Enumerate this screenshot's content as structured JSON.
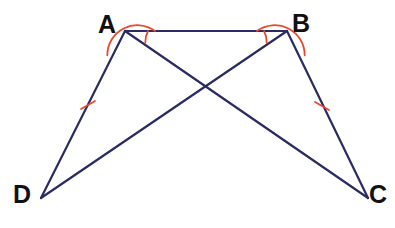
{
  "figure": {
    "type": "geometry-diagram",
    "canvas": {
      "width": 395,
      "height": 228
    },
    "background_color": "#ffffff",
    "line_color": "#2b2b63",
    "mark_color": "#e8492a",
    "label_color": "#111111",
    "line_width": 2.2,
    "mark_width": 1.8
  },
  "points": {
    "A": {
      "label": "A",
      "x": 125,
      "y": 31,
      "label_x": 98,
      "label_y": 12
    },
    "B": {
      "label": "B",
      "x": 287,
      "y": 31,
      "label_x": 292,
      "label_y": 11
    },
    "C": {
      "label": "C",
      "x": 368,
      "y": 198,
      "label_x": 369,
      "label_y": 182
    },
    "D": {
      "label": "D",
      "x": 41,
      "y": 198,
      "label_x": 13,
      "label_y": 182
    }
  },
  "segments": [
    {
      "name": "segment-AB",
      "from": "A",
      "to": "B"
    },
    {
      "name": "segment-AD",
      "from": "A",
      "to": "D"
    },
    {
      "name": "segment-BC",
      "from": "B",
      "to": "C"
    },
    {
      "name": "segment-AC",
      "from": "A",
      "to": "C"
    },
    {
      "name": "segment-BD",
      "from": "B",
      "to": "D"
    }
  ],
  "intersection": {
    "name": "diagonal-intersection",
    "x": 206,
    "y": 88
  },
  "tick_marks": [
    {
      "name": "tick-mark-AD",
      "on_segment": "segment-AD",
      "count": 1,
      "x": 88,
      "y": 105,
      "x1": 81,
      "y1": 109,
      "x2": 95,
      "y2": 101
    },
    {
      "name": "tick-mark-BC",
      "on_segment": "segment-BC",
      "count": 1,
      "x": 322,
      "y": 106,
      "x1": 315,
      "y1": 102,
      "x2": 329,
      "y2": 110
    }
  ],
  "angle_arcs": [
    {
      "name": "angle-arc-DAB",
      "vertex": "A",
      "radius": 30,
      "path": "M 107.3 55.3 A 30 30 0 0 1 155 31"
    },
    {
      "name": "angle-arc-CAB",
      "vertex": "A",
      "radius": 23,
      "path": "M 145.3 42.8 A 23 23 0 0 1 148 31"
    },
    {
      "name": "angle-arc-CBA",
      "vertex": "B",
      "radius": 30,
      "path": "M 257 31 A 30 30 0 0 1 304.7 55.3"
    },
    {
      "name": "angle-arc-DBA",
      "vertex": "B",
      "radius": 23,
      "path": "M 264 31 A 23 23 0 0 1 266.7 42.8"
    }
  ]
}
